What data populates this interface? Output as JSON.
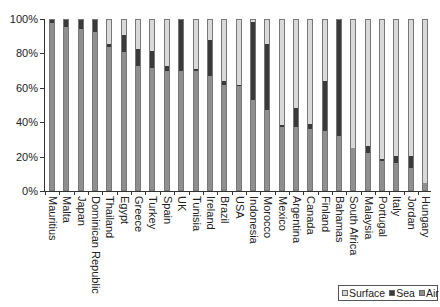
{
  "chart_data": {
    "type": "bar",
    "stacked": true,
    "percent": true,
    "title": "",
    "xlabel": "",
    "ylabel": "",
    "ylim": [
      0,
      100
    ],
    "yticks": [
      "0%",
      "20%",
      "40%",
      "60%",
      "80%",
      "100%"
    ],
    "grid": false,
    "legend_position": "bottom-right",
    "categories": [
      "Mauritius",
      "Malta",
      "Japan",
      "Dominican Republic",
      "Thailand",
      "Egypt",
      "Greece",
      "Turkey",
      "Spain",
      "UK",
      "Tunisia",
      "Ireland",
      "Brazil",
      "USA",
      "Indonesia",
      "Morocco",
      "Mexico",
      "Argentina",
      "Canada",
      "Finland",
      "Bahamas",
      "South Africa",
      "Malaysia",
      "Portugal",
      "Italy",
      "Jordan",
      "Hungary"
    ],
    "series": [
      {
        "name": "Air",
        "color": "#8f8f8f",
        "values": [
          98,
          96,
          95,
          93,
          84,
          81,
          73,
          72,
          70,
          70,
          70,
          67,
          62,
          61,
          53,
          47,
          37,
          37,
          36,
          35,
          32,
          25,
          22,
          17,
          16,
          13,
          4
        ]
      },
      {
        "name": "Sea",
        "color": "#3a3a3a",
        "values": [
          2,
          4,
          5,
          7,
          2,
          10,
          10,
          10,
          3,
          30,
          1,
          21,
          2,
          1,
          46,
          39,
          1,
          11,
          3,
          29,
          68,
          0,
          4,
          1,
          4,
          7,
          0
        ]
      },
      {
        "name": "Surface",
        "color": "#d9d9d9",
        "values": [
          0,
          0,
          0,
          0,
          14,
          9,
          17,
          18,
          27,
          0,
          29,
          12,
          36,
          38,
          1,
          14,
          62,
          52,
          61,
          36,
          0,
          75,
          74,
          82,
          80,
          80,
          96
        ]
      }
    ]
  },
  "legend": [
    {
      "label": "Surface",
      "color": "#d9d9d9"
    },
    {
      "label": "Sea",
      "color": "#3a3a3a"
    },
    {
      "label": "Air",
      "color": "#8f8f8f"
    }
  ]
}
